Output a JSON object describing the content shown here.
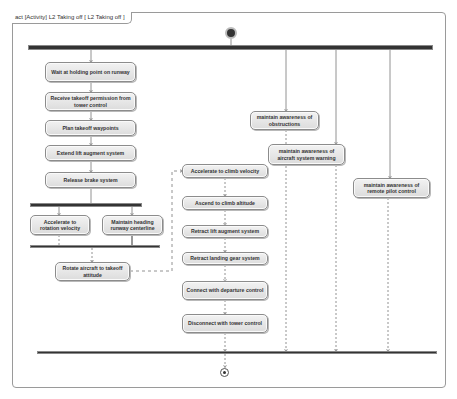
{
  "diagram": {
    "tab_label": "act [Activity] L2 Taking off [ L2 Taking off ]",
    "initial_node": {
      "icon": "initial-node-icon"
    },
    "final_node": {
      "icon": "activity-final-icon"
    },
    "actions": {
      "wait_holding": "Wait at holding point on runway",
      "receive_permission": "Receive takeoff permission from tower control",
      "plan_waypoints": "Plan takeoff waypoints",
      "extend_lift": "Extend lift augment system",
      "release_brake": "Release brake system",
      "accelerate_rotation": "Accelerate to rotation velocity",
      "maintain_heading": "Maintain heading runway centerline",
      "rotate_aircraft": "Rotate aircraft to takeoff attitude",
      "accelerate_climb": "Accelerate to climb velocity",
      "ascend_climb": "Ascend to climb altitude",
      "retract_lift": "Retract lift augment system",
      "retract_gear": "Retract landing gear system",
      "connect_departure": "Connect with departure control",
      "disconnect_tower": "Disconnect with tower control",
      "awareness_obstructions": "maintain awareness of obstructions",
      "awareness_warning": "maintain awareness of aircraft system warning",
      "awareness_remote": "maintain awareness of remote pilot control"
    },
    "colors": {
      "bar": "#333333",
      "action_fill_top": "#f2f2f2",
      "action_fill_bottom": "#dcdcdc",
      "action_border": "#8c8c8c",
      "edge": "#777777",
      "frame": "#9a9a9a"
    }
  }
}
